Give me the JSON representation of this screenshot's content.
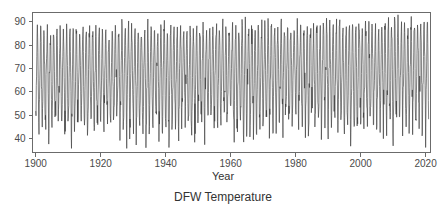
{
  "chart_data": {
    "type": "line",
    "title": "DFW Temperature",
    "subtitle": "",
    "xlabel": "Year",
    "ylabel": "",
    "xlim": [
      1899.0,
      2021.5
    ],
    "ylim": [
      34.0,
      94.0
    ],
    "grid": false,
    "legend": null,
    "xticks": [
      1900,
      1920,
      1940,
      1960,
      1980,
      2000,
      2020
    ],
    "xtick_labels": [
      "1900",
      "1920",
      "1940",
      "1960",
      "1980",
      "2000",
      "2020"
    ],
    "yticks": [
      40,
      50,
      60,
      70,
      80,
      90
    ],
    "ytick_labels": [
      "40",
      "50",
      "60",
      "70",
      "80",
      "90"
    ],
    "series_name": "Monthly mean temperature (degrees F)",
    "x_start": 1900.0,
    "x_step": 0.0833333,
    "n_points": 1452,
    "annotation": "Monthly mean temperature at DFW, strong annual seasonal cycle; summer peaks near 85-93, winter troughs near 36-50.",
    "seasonal_monthly_means": [
      45.0,
      49.5,
      57.0,
      65.5,
      73.5,
      81.5,
      85.5,
      85.0,
      78.0,
      67.0,
      55.5,
      46.5
    ],
    "seasonal_monthly_spread": [
      5.5,
      5.0,
      4.5,
      3.5,
      3.0,
      2.5,
      2.5,
      2.5,
      3.0,
      3.5,
      4.5,
      5.0
    ],
    "trend_per_century": 2.5,
    "y_data_min": 35.6,
    "y_data_max": 93.8
  },
  "labels": {
    "title": "DFW Temperature",
    "xaxis": "Year"
  }
}
